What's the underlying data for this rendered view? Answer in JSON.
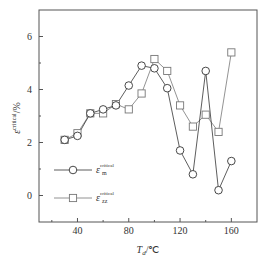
{
  "chart_data": {
    "type": "line",
    "title": "",
    "xlabel": "T_d/°C",
    "ylabel": "ε^critical/%",
    "xlim": [
      10,
      180
    ],
    "ylim": [
      -1,
      7
    ],
    "x_ticks": [
      40,
      80,
      120,
      160
    ],
    "x_minor_ticks": [
      20,
      60,
      100,
      140
    ],
    "y_ticks": [
      0,
      2,
      4,
      6
    ],
    "y_minor_ticks": [
      1,
      3,
      5
    ],
    "grid": false,
    "legend_position": "lower-left inside",
    "x": [
      30,
      40,
      50,
      60,
      70,
      80,
      90,
      100,
      110,
      120,
      130,
      140,
      150,
      160
    ],
    "series": [
      {
        "name": "ε_m^critical",
        "marker": "circle",
        "color": "#333333",
        "values": [
          2.1,
          2.25,
          3.1,
          3.25,
          3.4,
          4.15,
          4.9,
          4.8,
          4.05,
          1.7,
          0.8,
          4.7,
          0.2,
          1.3
        ]
      },
      {
        "name": "ε_zz^critical",
        "marker": "square",
        "color": "#777777",
        "values": [
          2.1,
          2.35,
          3.1,
          3.1,
          3.45,
          3.25,
          3.85,
          5.15,
          4.7,
          3.4,
          2.6,
          3.05,
          2.4,
          5.4
        ]
      }
    ]
  },
  "axis": {
    "x_label_main": "T",
    "x_label_sub": "d",
    "x_label_unit": "/℃",
    "y_label_main": "ε",
    "y_label_sup": "critical",
    "y_label_unit": "/%"
  },
  "legend": [
    {
      "symbol": "ε",
      "sub": "m",
      "sup": "critical"
    },
    {
      "symbol": "ε",
      "sub": "zz",
      "sup": "critical"
    }
  ]
}
